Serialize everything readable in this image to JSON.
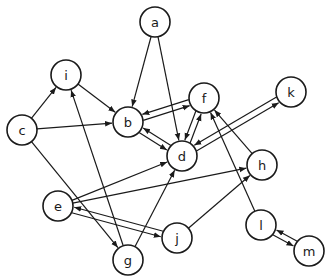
{
  "diagram": {
    "type": "directed-graph",
    "node_radius": 15,
    "colors": {
      "stroke": "#1a1a1a",
      "fill": "#ffffff",
      "background": "#ffffff"
    },
    "nodes": [
      {
        "id": "a",
        "label": "a",
        "x": 155,
        "y": 22
      },
      {
        "id": "i",
        "label": "i",
        "x": 66,
        "y": 75
      },
      {
        "id": "c",
        "label": "c",
        "x": 22,
        "y": 130
      },
      {
        "id": "b",
        "label": "b",
        "x": 128,
        "y": 122
      },
      {
        "id": "f",
        "label": "f",
        "x": 204,
        "y": 98
      },
      {
        "id": "k",
        "label": "k",
        "x": 291,
        "y": 92
      },
      {
        "id": "d",
        "label": "d",
        "x": 182,
        "y": 156
      },
      {
        "id": "h",
        "label": "h",
        "x": 262,
        "y": 165
      },
      {
        "id": "e",
        "label": "e",
        "x": 58,
        "y": 206
      },
      {
        "id": "j",
        "label": "j",
        "x": 177,
        "y": 238
      },
      {
        "id": "g",
        "label": "g",
        "x": 128,
        "y": 260
      },
      {
        "id": "l",
        "label": "l",
        "x": 261,
        "y": 225
      },
      {
        "id": "m",
        "label": "m",
        "x": 309,
        "y": 251
      }
    ],
    "edges": [
      {
        "from": "a",
        "to": "b"
      },
      {
        "from": "a",
        "to": "d"
      },
      {
        "from": "c",
        "to": "i"
      },
      {
        "from": "c",
        "to": "b"
      },
      {
        "from": "c",
        "to": "g"
      },
      {
        "from": "i",
        "to": "b"
      },
      {
        "from": "g",
        "to": "i"
      },
      {
        "from": "g",
        "to": "d"
      },
      {
        "from": "b",
        "to": "f",
        "offset": 3
      },
      {
        "from": "f",
        "to": "b",
        "offset": 3
      },
      {
        "from": "b",
        "to": "d",
        "offset": 3
      },
      {
        "from": "d",
        "to": "b",
        "offset": 3
      },
      {
        "from": "d",
        "to": "f",
        "offset": 3
      },
      {
        "from": "f",
        "to": "d",
        "offset": 3
      },
      {
        "from": "d",
        "to": "k",
        "offset": 3
      },
      {
        "from": "k",
        "to": "d",
        "offset": 3
      },
      {
        "from": "h",
        "to": "f"
      },
      {
        "from": "l",
        "to": "f"
      },
      {
        "from": "e",
        "to": "d"
      },
      {
        "from": "e",
        "to": "h"
      },
      {
        "from": "e",
        "to": "j",
        "offset": 3
      },
      {
        "from": "j",
        "to": "e",
        "offset": 3
      },
      {
        "from": "j",
        "to": "h"
      },
      {
        "from": "l",
        "to": "m",
        "offset": 3
      },
      {
        "from": "m",
        "to": "l",
        "offset": 3
      }
    ]
  }
}
